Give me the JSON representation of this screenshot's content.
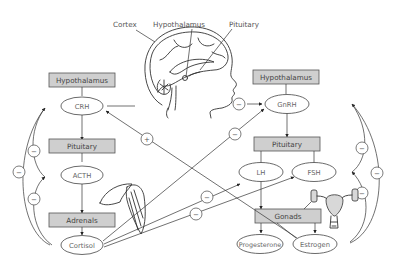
{
  "anatomy_labels": {
    "cortex": "Cortex",
    "hypothalamus": "Hypothalamus",
    "pituitary": "Pituitary"
  },
  "left_axis": {
    "hypothalamus_box": "Hypothalamus",
    "crh": "CRH",
    "pituitary_box": "Pituitary",
    "acth": "ACTH",
    "adrenals_box": "Adrenals",
    "cortisol": "Cortisol"
  },
  "right_axis": {
    "hypothalamus_box": "Hypothalamus",
    "gnrh": "GnRH",
    "pituitary_box": "Pituitary",
    "lh": "LH",
    "fsh": "FSH",
    "gonads_box": "Gonads",
    "progesterone": "Progesterone",
    "estrogen": "Estrogen"
  },
  "signs": {
    "minus": "−",
    "plus": "+"
  },
  "colors": {
    "box_fill": "#cfcfcf",
    "line": "#333333",
    "text": "#4a4a4a"
  }
}
